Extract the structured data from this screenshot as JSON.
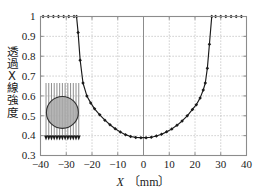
{
  "chart_data": {
    "type": "line",
    "title": "",
    "subtitle": "",
    "xlabel_symbol": "X",
    "xlabel_unit": "〔mm〕",
    "ylabel": "透過X線強度",
    "xlim": [
      -40,
      40
    ],
    "ylim": [
      0.3,
      1.0
    ],
    "xticks": [
      "-40",
      "-30",
      "-20",
      "-10",
      "0",
      "10",
      "20",
      "30",
      "40"
    ],
    "xtick_values": [
      -40,
      -30,
      -20,
      -10,
      0,
      10,
      20,
      30,
      40
    ],
    "yticks": [
      "0.3",
      "0.4",
      "0.5",
      "0.6",
      "0.7",
      "0.8",
      "0.9",
      "1"
    ],
    "ytick_values": [
      0.3,
      0.4,
      0.5,
      0.6,
      0.7,
      0.8,
      0.9,
      1.0
    ],
    "grid": true,
    "grid_style": "dotted",
    "legend": null,
    "legend_position": "none",
    "marker": "filled-diamond",
    "line_color": "#1a1a1a",
    "series": [
      {
        "name": "transmitted-x-ray-intensity",
        "x": [
          -39,
          -37,
          -35,
          -33,
          -31,
          -29,
          -27,
          -26,
          -25.4,
          -24.6,
          -23.5,
          -22,
          -20.5,
          -19,
          -17,
          -15,
          -13,
          -11,
          -9,
          -7,
          -5,
          -3,
          -1,
          1,
          3,
          5,
          7,
          9,
          11,
          13,
          15,
          17,
          19,
          20.5,
          22,
          23.2,
          24,
          24.8,
          25.6,
          26.5,
          28,
          30,
          32,
          34,
          36,
          38
        ],
        "y": [
          1.0,
          1.0,
          1.0,
          1.0,
          1.0,
          1.0,
          1.0,
          1.0,
          0.92,
          0.78,
          0.665,
          0.6,
          0.565,
          0.535,
          0.505,
          0.478,
          0.455,
          0.435,
          0.418,
          0.405,
          0.396,
          0.391,
          0.39,
          0.39,
          0.392,
          0.398,
          0.407,
          0.419,
          0.434,
          0.452,
          0.474,
          0.5,
          0.532,
          0.556,
          0.59,
          0.63,
          0.665,
          0.74,
          0.86,
          1.0,
          1.0,
          1.0,
          1.0,
          1.0,
          1.0,
          1.0
        ]
      }
    ],
    "annotations": {
      "inset": {
        "name": "sample-cross-section-diagram",
        "shape": "circle",
        "fill_color": "#a8a8a8",
        "stroke_color": "#303030",
        "beam_lines": 13,
        "beam_direction": "downward",
        "beam_color": "#808080",
        "center_x_mm": -31.5,
        "center_y_value": 0.517,
        "radius_mm": 6.2
      }
    },
    "axis_color": "#8c8c8c",
    "background": "#ffffff"
  }
}
